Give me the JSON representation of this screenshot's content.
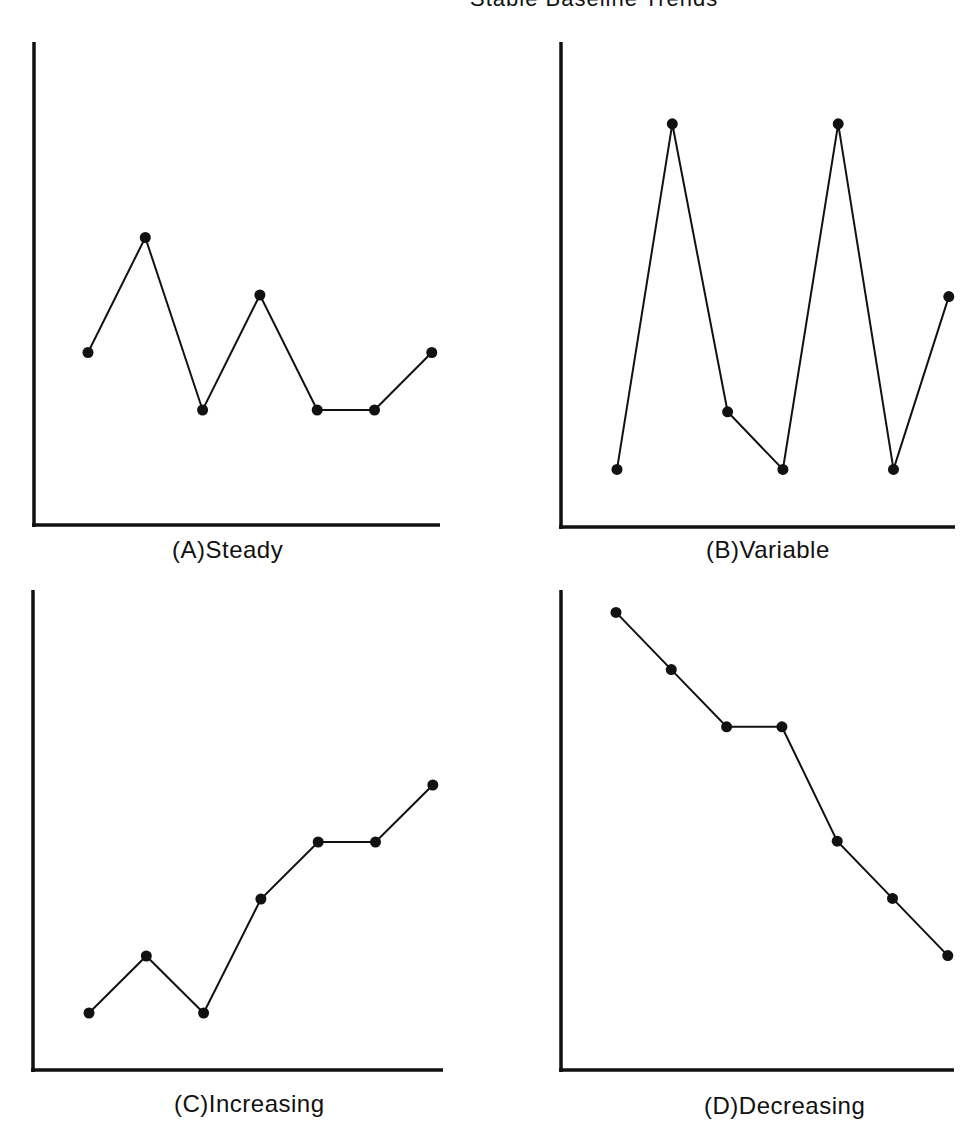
{
  "title": "Stable Baseline Trends",
  "colors": {
    "line": "#111111",
    "background": "#ffffff"
  },
  "chart_data": [
    {
      "type": "line",
      "title": "(A) Steady",
      "caption_letter": "(A)",
      "caption_text": "Steady",
      "xlabel": "",
      "ylabel": "",
      "x": [
        1,
        2,
        3,
        4,
        5,
        6,
        7
      ],
      "values": [
        3,
        5,
        2,
        4,
        2,
        2,
        3
      ],
      "ylim": [
        0,
        8.4
      ],
      "grid": false,
      "markers": true,
      "tick_labels": false
    },
    {
      "type": "line",
      "title": "(B) Variable",
      "caption_letter": "(B)",
      "caption_text": "Variable",
      "xlabel": "",
      "ylabel": "",
      "x": [
        1,
        2,
        3,
        4,
        5,
        6,
        7
      ],
      "values": [
        1,
        7,
        2,
        1,
        7,
        1,
        4
      ],
      "ylim": [
        0,
        8.4
      ],
      "grid": false,
      "markers": true,
      "tick_labels": false
    },
    {
      "type": "line",
      "title": "(C) Increasing",
      "caption_letter": "(C)",
      "caption_text": "Increasing",
      "xlabel": "",
      "ylabel": "",
      "x": [
        1,
        2,
        3,
        4,
        5,
        6,
        7
      ],
      "values": [
        1,
        2,
        1,
        3,
        4,
        4,
        5
      ],
      "ylim": [
        0,
        8.4
      ],
      "grid": false,
      "markers": true,
      "tick_labels": false
    },
    {
      "type": "line",
      "title": "(D) Decreasing",
      "caption_letter": "(D)",
      "caption_text": "Decreasing",
      "xlabel": "",
      "ylabel": "",
      "x": [
        1,
        2,
        3,
        4,
        5,
        6,
        7
      ],
      "values": [
        8,
        7,
        6,
        6,
        4,
        3,
        2
      ],
      "ylim": [
        0,
        8.4
      ],
      "grid": false,
      "markers": true,
      "tick_labels": false
    }
  ]
}
